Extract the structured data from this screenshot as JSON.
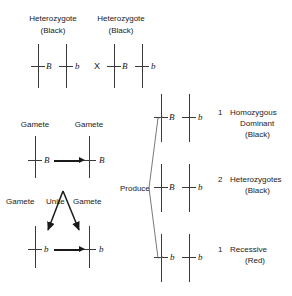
{
  "diagram": {
    "parents": [
      {
        "label_line1": "Heterozygote",
        "label_line2": "(Black)",
        "alleles": [
          "B",
          "b"
        ]
      },
      {
        "label_line1": "Heterozygote",
        "label_line2": "(Black)",
        "alleles": [
          "B",
          "b"
        ]
      }
    ],
    "cross_symbol": "X",
    "gametes": {
      "top_label_left": "Gamete",
      "top_label_right": "Gamete",
      "top_alleles": [
        "B",
        "B"
      ],
      "unite_label_left": "Gamete",
      "unite_label_center": "Unite",
      "unite_label_right": "Gamete",
      "bottom_alleles": [
        "b",
        "b"
      ]
    },
    "produce_label": "Produce",
    "offspring": [
      {
        "alleles": [
          "B",
          "b"
        ],
        "count": "1",
        "name_line1": "Homozygous",
        "name_line2": "Dominant",
        "phenotype": "(Black)"
      },
      {
        "alleles": [
          "B",
          "b"
        ],
        "count": "2",
        "name_line1": "Heterozygotes",
        "name_line2": "",
        "phenotype": "(Black)"
      },
      {
        "alleles": [
          "b",
          "b"
        ],
        "count": "1",
        "name_line1": "Recessive",
        "name_line2": "",
        "phenotype": "(Red)"
      }
    ],
    "colors": {
      "ink": "#1a1a1a",
      "chromosome": "#3a3a3a",
      "background": "#ffffff"
    }
  }
}
